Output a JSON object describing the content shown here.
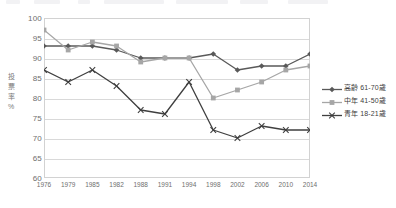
{
  "chart_data": {
    "type": "line",
    "title": "",
    "xlabel": "",
    "ylabel": "投票率 %",
    "ylim": [
      60,
      100
    ],
    "ytick_step": 5,
    "grid": true,
    "legend_position": "right",
    "categories": [
      "1976",
      "1979",
      "1985",
      "1982",
      "1988",
      "1991",
      "1994",
      "1998",
      "2002",
      "2006",
      "2010",
      "2014"
    ],
    "yticks": [
      "100",
      "95",
      "90",
      "85",
      "80",
      "75",
      "70",
      "65",
      "60"
    ],
    "series": [
      {
        "name": "高齡 61-70歲",
        "color": "#595959",
        "marker": "diamond",
        "values": [
          93,
          93,
          93,
          92,
          90,
          90,
          90,
          91,
          87,
          88,
          88,
          91
        ]
      },
      {
        "name": "中年 41-50歲",
        "color": "#a6a6a6",
        "marker": "square",
        "values": [
          97,
          92,
          94,
          93,
          89,
          90,
          90,
          80,
          82,
          84,
          87,
          88
        ]
      },
      {
        "name": "青年 18-21歲",
        "color": "#3f3f3f",
        "marker": "cross",
        "values": [
          87,
          84,
          87,
          83,
          77,
          76,
          84,
          72,
          70,
          73,
          72,
          72
        ]
      }
    ]
  },
  "axis": {
    "y_title_chars": [
      "投",
      "票",
      "率",
      "%"
    ]
  }
}
